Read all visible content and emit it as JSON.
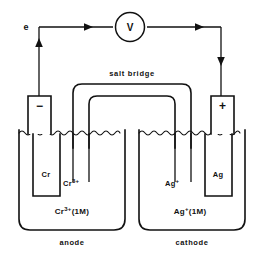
{
  "diagram": {
    "background_color": "#ffffff",
    "line_color": "#111111"
  },
  "circuit": {
    "electron_label": "e",
    "meter_label": "V",
    "meter_name": "voltmeter",
    "arrow_direction": "left-to-right"
  },
  "salt_bridge": {
    "label": "salt bridge"
  },
  "left_cell": {
    "terminal_sign": "−",
    "electrode_label": "Cr",
    "ion_label_base": "Cr",
    "ion_label_sup": "3+",
    "solution_base": "Cr",
    "solution_sup": "3+",
    "solution_conc": "(1M)",
    "role_label": "anode"
  },
  "right_cell": {
    "terminal_sign": "+",
    "electrode_label": "Ag",
    "ion_label_base": "Ag",
    "ion_label_sup": "+",
    "solution_base": "Ag",
    "solution_sup": "+",
    "solution_conc": "(1M)",
    "role_label": "cathode"
  }
}
